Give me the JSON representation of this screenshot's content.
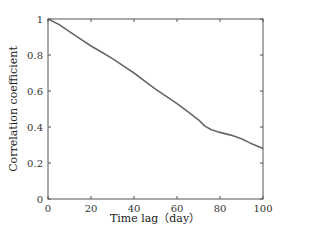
{
  "chart_data": {
    "type": "line",
    "title": "",
    "xlabel": "Time lag（day）",
    "ylabel": "Correlation coefficient",
    "xlim": [
      0,
      100
    ],
    "ylim": [
      0,
      1
    ],
    "xticks": [
      0,
      20,
      40,
      60,
      80,
      100
    ],
    "yticks": [
      0,
      0.2,
      0.4,
      0.6,
      0.8,
      1
    ],
    "xtick_labels": [
      "0",
      "20",
      "40",
      "60",
      "80",
      "100"
    ],
    "ytick_labels": [
      "0",
      "0.2",
      "0.4",
      "0.6",
      "0.8",
      "1"
    ],
    "grid": false,
    "legend": null,
    "series": [
      {
        "name": "Correlation coefficient",
        "color": "#666666",
        "x": [
          0,
          5,
          10,
          15,
          20,
          25,
          30,
          35,
          40,
          45,
          50,
          55,
          60,
          65,
          70,
          73,
          76,
          80,
          85,
          90,
          95,
          100
        ],
        "values": [
          1.0,
          0.97,
          0.93,
          0.89,
          0.85,
          0.815,
          0.78,
          0.74,
          0.7,
          0.655,
          0.61,
          0.57,
          0.53,
          0.485,
          0.44,
          0.405,
          0.385,
          0.37,
          0.355,
          0.335,
          0.305,
          0.28
        ]
      }
    ]
  },
  "colors": {
    "axis": "#555555",
    "line": "#666666",
    "background": "#ffffff"
  }
}
